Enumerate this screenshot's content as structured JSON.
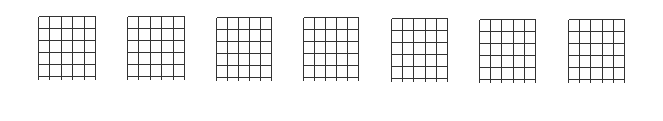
{
  "diagram": {
    "type": "blank-chord-charts",
    "count": 7,
    "strings": 6,
    "frets": 5,
    "line_color": "#333333",
    "charts": [
      {
        "x": 38,
        "y": 16,
        "w": 57,
        "h": 60
      },
      {
        "x": 127,
        "y": 16,
        "w": 57,
        "h": 60
      },
      {
        "x": 216,
        "y": 17,
        "w": 55,
        "h": 60
      },
      {
        "x": 303,
        "y": 17,
        "w": 55,
        "h": 60
      },
      {
        "x": 391,
        "y": 18,
        "w": 56,
        "h": 60
      },
      {
        "x": 479,
        "y": 19,
        "w": 56,
        "h": 60
      },
      {
        "x": 568,
        "y": 19,
        "w": 56,
        "h": 60
      }
    ]
  }
}
